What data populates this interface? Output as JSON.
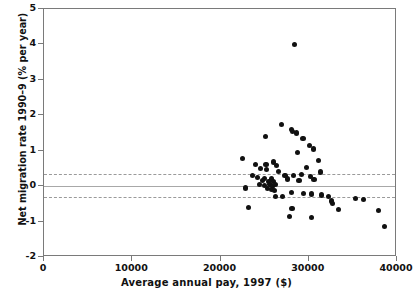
{
  "chart_data": {
    "type": "scatter",
    "title": "",
    "xlabel": "Average annual pay, 1997 ($)",
    "ylabel": "Net migration rate 1990–9 (% per year)",
    "xlim": [
      0,
      40000
    ],
    "ylim": [
      -2,
      5
    ],
    "xticks": [
      0,
      10000,
      20000,
      30000,
      40000
    ],
    "xtick_labels": [
      "0",
      "10000",
      "20000",
      "30000",
      "40000"
    ],
    "yticks": [
      -2,
      -1,
      0,
      1,
      2,
      3,
      4,
      5
    ],
    "ytick_labels": [
      "-2",
      "-1",
      "0",
      "1",
      "2",
      "3",
      "4",
      "5"
    ],
    "grid": false,
    "legend": null,
    "marker": "filled-circle",
    "marker_color": "#111111",
    "reference_lines": [
      {
        "name": "upper-confidence-band",
        "y": 0.35,
        "style": "dashed",
        "color": "#9a9a9a"
      },
      {
        "name": "zero-line",
        "y": 0.0,
        "style": "solid",
        "color": "#a8a8a8"
      },
      {
        "name": "lower-confidence-band",
        "y": -0.3,
        "style": "dashed",
        "color": "#9a9a9a"
      }
    ],
    "points": [
      [
        28400,
        4.0
      ],
      [
        26900,
        1.75
      ],
      [
        28050,
        1.6
      ],
      [
        28150,
        1.55
      ],
      [
        28600,
        1.5
      ],
      [
        25100,
        1.4
      ],
      [
        29350,
        1.35
      ],
      [
        30100,
        1.15
      ],
      [
        30500,
        1.05
      ],
      [
        28750,
        0.95
      ],
      [
        22500,
        0.78
      ],
      [
        31100,
        0.72
      ],
      [
        24000,
        0.62
      ],
      [
        26000,
        0.68
      ],
      [
        25150,
        0.6
      ],
      [
        26350,
        0.58
      ],
      [
        29700,
        0.52
      ],
      [
        24500,
        0.5
      ],
      [
        25200,
        0.46
      ],
      [
        26600,
        0.42
      ],
      [
        31350,
        0.4
      ],
      [
        23650,
        0.3
      ],
      [
        27300,
        0.3
      ],
      [
        28300,
        0.3
      ],
      [
        29200,
        0.32
      ],
      [
        30200,
        0.28
      ],
      [
        24200,
        0.25
      ],
      [
        25000,
        0.22
      ],
      [
        25750,
        0.2
      ],
      [
        27600,
        0.2
      ],
      [
        30600,
        0.18
      ],
      [
        24750,
        0.15
      ],
      [
        25400,
        0.12
      ],
      [
        26050,
        0.12
      ],
      [
        28900,
        0.15
      ],
      [
        24400,
        0.05
      ],
      [
        25000,
        0.02
      ],
      [
        25600,
        0.05
      ],
      [
        25900,
        0.0
      ],
      [
        26250,
        0.04
      ],
      [
        22800,
        -0.05
      ],
      [
        25300,
        -0.06
      ],
      [
        25750,
        -0.1
      ],
      [
        26100,
        -0.12
      ],
      [
        28000,
        -0.18
      ],
      [
        29400,
        -0.2
      ],
      [
        30350,
        -0.22
      ],
      [
        31400,
        -0.25
      ],
      [
        26200,
        -0.3
      ],
      [
        27000,
        -0.3
      ],
      [
        32200,
        -0.3
      ],
      [
        35300,
        -0.35
      ],
      [
        36200,
        -0.38
      ],
      [
        32600,
        -0.42
      ],
      [
        32650,
        -0.48
      ],
      [
        23200,
        -0.6
      ],
      [
        28100,
        -0.62
      ],
      [
        33400,
        -0.65
      ],
      [
        37900,
        -0.68
      ],
      [
        27850,
        -0.85
      ],
      [
        30300,
        -0.88
      ],
      [
        38600,
        -1.15
      ]
    ],
    "n_points": 62
  },
  "axes": {
    "x_label": "Average annual pay, 1997 ($)",
    "y_label": "Net migration rate 1990–9 (% per year)"
  }
}
